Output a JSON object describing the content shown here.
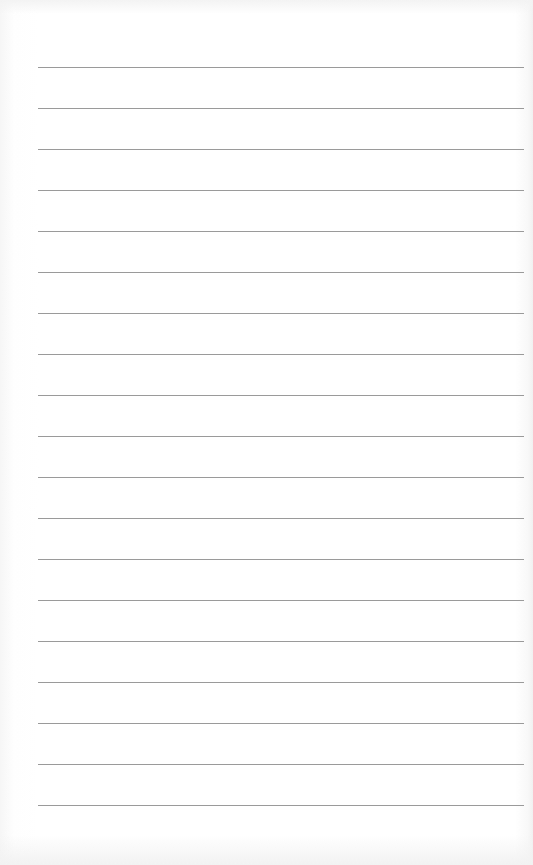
{
  "paper": {
    "type": "lined-paper",
    "line_count": 19,
    "first_line_y": 67,
    "line_spacing": 41,
    "line_left": 38,
    "line_right": 524,
    "line_color": "#9a9a9a",
    "background_color": "#ffffff"
  }
}
